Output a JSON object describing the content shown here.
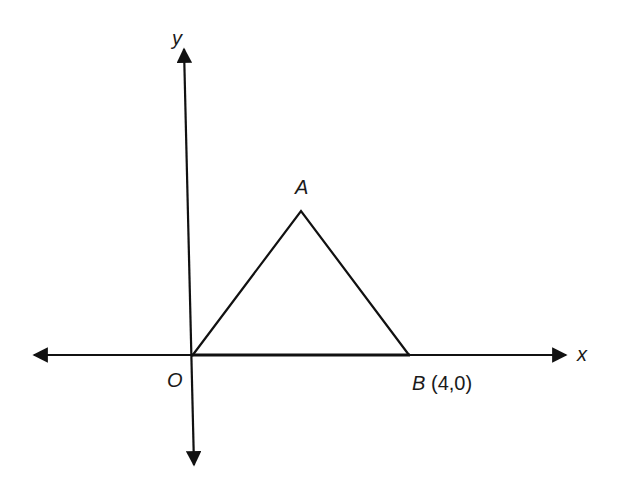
{
  "diagram": {
    "axes": {
      "x_label": "x",
      "y_label": "y"
    },
    "points": {
      "origin": {
        "label": "O"
      },
      "A": {
        "label": "A"
      },
      "B": {
        "label": "B",
        "coords": "(4,0)"
      }
    },
    "colors": {
      "stroke": "#111111",
      "background": "#ffffff"
    }
  }
}
